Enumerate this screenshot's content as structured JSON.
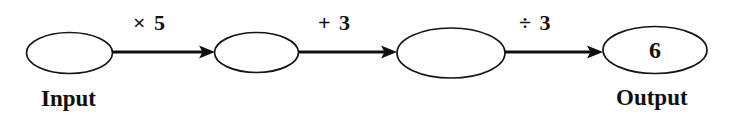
{
  "diagram": {
    "type": "function-machine-flow",
    "background_color": "#ffffff",
    "stroke_color": "#101010",
    "nodes": [
      {
        "id": "node-input",
        "value": "",
        "label": "Input",
        "cx": 69.5,
        "cy": 53,
        "rx": 43,
        "ry": 20.5
      },
      {
        "id": "node-step-1",
        "value": "",
        "label": "",
        "cx": 256.5,
        "cy": 52.5,
        "rx": 42,
        "ry": 20
      },
      {
        "id": "node-step-2",
        "value": "",
        "label": "",
        "cx": 451,
        "cy": 53,
        "rx": 54,
        "ry": 25
      },
      {
        "id": "node-output",
        "value": "6",
        "label": "Output",
        "cx": 655,
        "cy": 50,
        "rx": 52,
        "ry": 23.5
      }
    ],
    "operations": [
      {
        "id": "op-multiply",
        "label": "× 5",
        "from": "node-input",
        "to": "node-step-1",
        "x1": 112,
        "x2": 215,
        "y": 52
      },
      {
        "id": "op-add",
        "label": "+ 3",
        "from": "node-step-1",
        "to": "node-step-2",
        "x1": 299,
        "x2": 397,
        "y": 52
      },
      {
        "id": "op-divide",
        "label": "÷ 3",
        "from": "node-step-2",
        "to": "node-output",
        "x1": 505,
        "x2": 603,
        "y": 52
      }
    ],
    "end_labels": [
      {
        "id": "label-input",
        "text": "Input",
        "x": 41,
        "y": 87
      },
      {
        "id": "label-output",
        "text": "Output",
        "x": 616,
        "y": 86
      }
    ],
    "op_label_positions": [
      {
        "x": 133,
        "y": 12
      },
      {
        "x": 318,
        "y": 12
      },
      {
        "x": 519,
        "y": 12
      }
    ]
  }
}
